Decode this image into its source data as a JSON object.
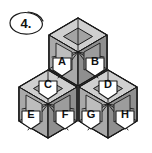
{
  "figure": {
    "number_label": "4.",
    "caption_shape": "ellipse-callout",
    "background_color": "#ffffff",
    "line_color": "#1a1a1a"
  },
  "palette": {
    "top_face": "#b5b5b5",
    "left_face": "#9a9a9a",
    "right_face": "#8d8d8d",
    "top_face_light": "#cfcfcf",
    "left_face_light": "#bcbcbc",
    "right_face_light": "#a8a8a8",
    "inner_plate": "#a0a0a0",
    "label_fill": "#ffffff",
    "stroke": "#1a1a1a"
  },
  "diagram": {
    "type": "isometric-cube-stack",
    "cube_count": 3,
    "arrangement": "one cube on top, two cubes below",
    "cubes": [
      {
        "id": "cube-top",
        "row": "upper",
        "cx": 78,
        "cy": 52,
        "labels": [
          "A",
          "B"
        ]
      },
      {
        "id": "cube-bottom-left",
        "row": "lower",
        "cx": 48,
        "cy": 104,
        "labels": [
          "C",
          "E",
          "F"
        ]
      },
      {
        "id": "cube-bottom-right",
        "row": "lower",
        "cx": 108,
        "cy": 104,
        "labels": [
          "D",
          "G",
          "H"
        ]
      }
    ],
    "labels": [
      {
        "key": "A",
        "text": "A",
        "x": 62,
        "y": 66,
        "cube": "cube-top",
        "face": "left"
      },
      {
        "key": "B",
        "text": "B",
        "x": 95,
        "y": 66,
        "cube": "cube-top",
        "face": "right"
      },
      {
        "key": "C",
        "text": "C",
        "x": 48,
        "y": 89,
        "cube": "cube-bottom-left",
        "face": "top"
      },
      {
        "key": "D",
        "text": "D",
        "x": 108,
        "y": 89,
        "cube": "cube-bottom-right",
        "face": "top"
      },
      {
        "key": "E",
        "text": "E",
        "x": 31,
        "y": 119,
        "cube": "cube-bottom-left",
        "face": "left"
      },
      {
        "key": "F",
        "text": "F",
        "x": 65,
        "y": 119,
        "cube": "cube-bottom-left",
        "face": "right"
      },
      {
        "key": "G",
        "text": "G",
        "x": 91,
        "y": 119,
        "cube": "cube-bottom-right",
        "face": "left"
      },
      {
        "key": "H",
        "text": "H",
        "x": 125,
        "y": 119,
        "cube": "cube-bottom-right",
        "face": "right"
      }
    ]
  }
}
